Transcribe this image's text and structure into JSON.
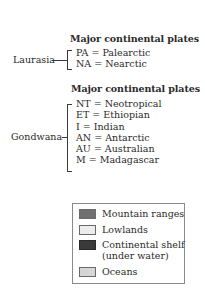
{
  "laurasia": {
    "heading": "Major continental plates",
    "group": "Laurasia",
    "plates": [
      "PA = Palearctic",
      "NA = Nearctic"
    ]
  },
  "gondwana": {
    "heading": "Major continental plates",
    "group": "Gondwana",
    "plates": [
      "NT = Neotropical",
      "ET = Ethiopian",
      "I = Indian",
      "AN = Antarctic",
      "AU = Australian",
      "M = Madagascar"
    ]
  },
  "legend": {
    "items": [
      {
        "label": "Mountain ranges",
        "color": "#707070"
      },
      {
        "label": "Lowlands",
        "color": "#ececec"
      },
      {
        "label": "Continental shelf (under water)",
        "line1": "Continental shelf",
        "line2": "(under water)",
        "color": "#3a3a3a"
      },
      {
        "label": "Oceans",
        "color": "#d6d6d6"
      }
    ]
  }
}
